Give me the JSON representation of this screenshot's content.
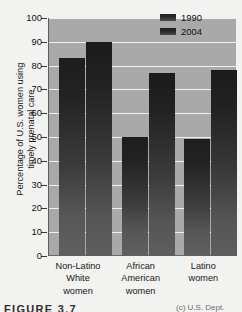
{
  "figure": {
    "caption_label": "FIGURE 3.7",
    "caption_credit": "(c) U.S. Dept."
  },
  "chart_data": {
    "type": "bar",
    "title": "",
    "xlabel": "",
    "ylabel": "Percentage of U.S. women using\ntimely prenatal care",
    "ylim": [
      0,
      100
    ],
    "ytick_labels": [
      "100",
      "90",
      "80",
      "70",
      "60",
      "50",
      "40",
      "30",
      "20",
      "10",
      "0"
    ],
    "ytick_values": [
      100,
      90,
      80,
      70,
      60,
      50,
      40,
      30,
      20,
      10,
      0
    ],
    "grid": true,
    "legend_position": "top-right",
    "categories": [
      "Non-Latino\nWhite\nwomen",
      "African\nAmerican\nwomen",
      "Latino\nwomen"
    ],
    "series": [
      {
        "name": "1990",
        "values": [
          83,
          50,
          49
        ],
        "color": "#2b2b2b"
      },
      {
        "name": "2004",
        "values": [
          90,
          77,
          78
        ],
        "color": "#282828"
      }
    ],
    "plot_background": "#a9a9a9",
    "gridline_color": "#f0f0ee"
  }
}
